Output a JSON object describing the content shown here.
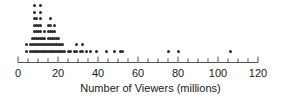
{
  "chart_data": {
    "type": "dotplot",
    "title": "",
    "xlabel": "Number of Viewers (millions)",
    "ylabel": "",
    "xlim": [
      0,
      120
    ],
    "grid": false,
    "legend": null,
    "major_tick_step": 20,
    "minor_tick_step": 5,
    "tick_labels": [
      "0",
      "20",
      "40",
      "60",
      "80",
      "100",
      "120"
    ],
    "tick_values": [
      0,
      20,
      40,
      60,
      80,
      100,
      120
    ],
    "dot_color": "#2b2b2b",
    "axis_color": "#555555",
    "stacks": [
      {
        "value": 4,
        "count": 2
      },
      {
        "value": 6,
        "count": 2
      },
      {
        "value": 7,
        "count": 3
      },
      {
        "value": 8,
        "count": 8
      },
      {
        "value": 9,
        "count": 6
      },
      {
        "value": 10,
        "count": 5
      },
      {
        "value": 11,
        "count": 8
      },
      {
        "value": 12,
        "count": 3
      },
      {
        "value": 13,
        "count": 4
      },
      {
        "value": 14,
        "count": 2
      },
      {
        "value": 15,
        "count": 5
      },
      {
        "value": 16,
        "count": 6
      },
      {
        "value": 17,
        "count": 4
      },
      {
        "value": 18,
        "count": 5
      },
      {
        "value": 19,
        "count": 3
      },
      {
        "value": 20,
        "count": 3
      },
      {
        "value": 21,
        "count": 2
      },
      {
        "value": 22,
        "count": 2
      },
      {
        "value": 23,
        "count": 1
      },
      {
        "value": 25,
        "count": 1
      },
      {
        "value": 26,
        "count": 1
      },
      {
        "value": 28,
        "count": 1
      },
      {
        "value": 29,
        "count": 2
      },
      {
        "value": 31,
        "count": 1
      },
      {
        "value": 32,
        "count": 2
      },
      {
        "value": 34,
        "count": 1
      },
      {
        "value": 36,
        "count": 1
      },
      {
        "value": 39,
        "count": 1
      },
      {
        "value": 44,
        "count": 1
      },
      {
        "value": 48,
        "count": 1
      },
      {
        "value": 51,
        "count": 1
      },
      {
        "value": 52,
        "count": 1
      },
      {
        "value": 75,
        "count": 1
      },
      {
        "value": 80,
        "count": 1
      },
      {
        "value": 106,
        "count": 1
      }
    ]
  },
  "geometry": {
    "x_origin_px": 18,
    "px_per_unit": 2.0,
    "baseline_y_px": 51,
    "row_spacing_px": 6.5
  }
}
